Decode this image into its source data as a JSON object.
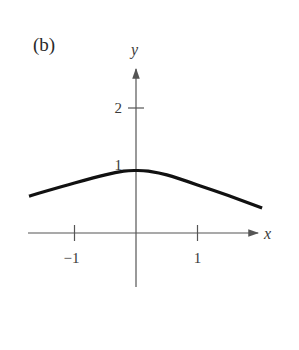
{
  "panel_label": "(b)",
  "colors": {
    "axis": "#555555",
    "curve": "#111111",
    "text": "#3a3a3a"
  },
  "chart_data": {
    "type": "line",
    "title": "",
    "panel": "(b)",
    "xlabel": "x",
    "ylabel": "y",
    "x_ticks": [
      {
        "value": -1,
        "label": "−1"
      },
      {
        "value": 1,
        "label": "1"
      }
    ],
    "y_ticks": [
      {
        "value": 1,
        "label": "1"
      },
      {
        "value": 2,
        "label": "2"
      }
    ],
    "xlim": [
      -1.8,
      2.2
    ],
    "ylim": [
      -0.85,
      2.6
    ],
    "grid": false,
    "legend": null,
    "series": [
      {
        "name": "curve",
        "x": [
          -1.74,
          -1.5,
          -1.0,
          -0.5,
          -0.2,
          0.0,
          0.2,
          0.5,
          1.0,
          1.5,
          2.05
        ],
        "y": [
          0.59,
          0.66,
          0.8,
          0.93,
          0.99,
          1.0,
          0.99,
          0.93,
          0.77,
          0.6,
          0.4
        ]
      }
    ]
  }
}
